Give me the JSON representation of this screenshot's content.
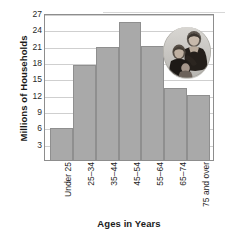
{
  "chart_data": {
    "type": "bar",
    "title": "",
    "xlabel": "Ages in Years",
    "ylabel": "Millions of Households",
    "categories": [
      "Under 25",
      "25–34",
      "35–44",
      "45–54",
      "55–64",
      "65–74",
      "75 and over"
    ],
    "values": [
      5.8,
      17.5,
      20.7,
      25.4,
      20.9,
      13.2,
      11.9
    ],
    "ylim": [
      0,
      27
    ],
    "ytick_labels": [
      "3",
      "6",
      "9",
      "12",
      "15",
      "18",
      "21",
      "24",
      "27"
    ],
    "ytick_values": [
      3,
      6,
      9,
      12,
      15,
      18,
      21,
      24,
      27
    ],
    "grid": true,
    "legend": "none",
    "bar_color": "#a9a9a9",
    "bar_border_color": "#8f8f8f",
    "gridline_color": "#cfcfcf",
    "frame_color": "#8d8d8d",
    "xtick_rotation": -90
  },
  "inset": {
    "name": "family-photo",
    "description": "Oval grayscale photograph of a family",
    "position": "upper-right of plot area"
  }
}
